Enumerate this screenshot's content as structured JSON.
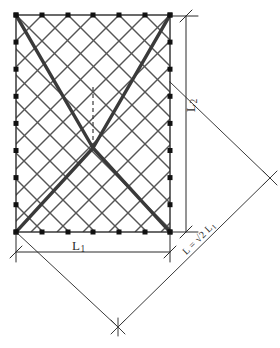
{
  "figure": {
    "labels": {
      "width_label": "L",
      "width_sub": "1",
      "height_label": "L",
      "height_sub": "2",
      "diagonal_label_prefix": "L = ",
      "diagonal_label_radical": "√2",
      "diagonal_label_suffix": " L",
      "diagonal_label_sub": "1"
    },
    "ink_color": "#2b2b2b",
    "mesh_color": "#555555",
    "bold_color": "#3a3a3a",
    "rect": {
      "x": 16,
      "y": 15,
      "width": 154,
      "height": 217
    },
    "nodes": {
      "top_count": 7,
      "bottom_count": 7,
      "left_count": 9,
      "right_count": 9,
      "marker_size": 5
    },
    "mesh": {
      "columns": 6,
      "rows": 8,
      "style": "diagonal-diamond"
    },
    "bold_diagonals": {
      "shape": "V-and-lambda",
      "meet_point_x": 93,
      "upper_meet_y": 148,
      "lower_meet_y": 148
    },
    "center_dashed_line": {
      "x": 93,
      "y_top": 87,
      "y_bottom": 148
    },
    "rotated_square": {
      "vertices": [
        [
          16,
          232
        ],
        [
          118,
          327
        ],
        [
          270,
          178
        ],
        [
          170,
          82
        ]
      ],
      "note": "diamond anchored at rectangle bottom-left and bottom-right",
      "tick_marks": 2
    },
    "dimension_lines": {
      "horizontal": {
        "y": 252,
        "x1": 16,
        "x2": 170,
        "tick_style": "slash"
      },
      "vertical": {
        "x": 186,
        "y1": 18,
        "y2": 232,
        "tick_style": "slash"
      }
    }
  }
}
